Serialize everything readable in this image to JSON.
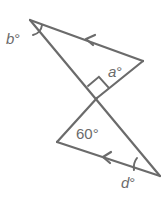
{
  "diagram": {
    "type": "geometry",
    "colors": {
      "stroke": "#6b6b6b",
      "label": "#6b6b6b",
      "background": "#ffffff"
    },
    "labels": {
      "b": "b°",
      "a": "a°",
      "angle_60": "60°",
      "d": "d°"
    },
    "markers": {
      "right_angle": "right angle at intersection (upper triangle)",
      "parallel_arrows": "arrows on top side and bottom side indicate parallel lines",
      "angle_arcs": [
        "arc at b vertex",
        "arc at d vertex"
      ]
    },
    "vertices": {
      "top_left": [
        30,
        20
      ],
      "top_right": [
        143,
        61
      ],
      "intersection": [
        97,
        98
      ],
      "bottom_left": [
        57,
        142
      ],
      "bottom_right": [
        160,
        176
      ]
    }
  }
}
